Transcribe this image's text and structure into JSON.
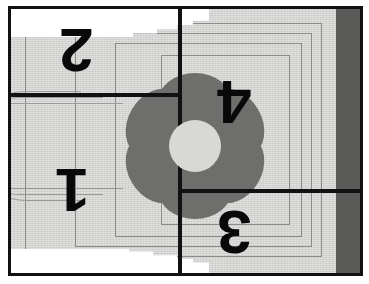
{
  "image": {
    "title": "Quilt panel photographed with four numbered quadrants",
    "width": 369,
    "height": 284
  },
  "colors": {
    "frame": "#111111",
    "cloth": "#d3d3d1",
    "petal": "#6e6e6c",
    "flower_center": "#d8d8d5",
    "shadow_band": "#5a5a58",
    "stitch_line": "#8b8b89",
    "glare": "#ffffff",
    "numeral": "#090909"
  },
  "quadrants": [
    {
      "id": "quadrant-1",
      "label": "1",
      "position": "bottom-left",
      "rotation_deg": 180
    },
    {
      "id": "quadrant-2",
      "label": "2",
      "position": "top-left",
      "rotation_deg": 180
    },
    {
      "id": "quadrant-3",
      "label": "3",
      "position": "bottom-right",
      "rotation_deg": 180
    },
    {
      "id": "quadrant-4",
      "label": "4",
      "position": "top-right",
      "rotation_deg": 180
    }
  ],
  "flower": {
    "petal_count": 6,
    "petals": [
      {
        "angle_deg": 0,
        "width": 74,
        "height": 58,
        "offset": 44
      },
      {
        "angle_deg": 60,
        "width": 74,
        "height": 58,
        "offset": 44
      },
      {
        "angle_deg": 120,
        "width": 74,
        "height": 58,
        "offset": 44
      },
      {
        "angle_deg": 180,
        "width": 74,
        "height": 58,
        "offset": 44
      },
      {
        "angle_deg": 240,
        "width": 74,
        "height": 58,
        "offset": 44
      },
      {
        "angle_deg": 300,
        "width": 74,
        "height": 58,
        "offset": 44
      }
    ]
  },
  "grid": {
    "vertical_divider_x": 167,
    "horizontal_left_y": 84,
    "horizontal_right_y": 180,
    "line_thickness": 4
  },
  "stitch_outlines": [
    {
      "id": "stitch-outline-1"
    },
    {
      "id": "stitch-outline-2"
    },
    {
      "id": "stitch-outline-3"
    },
    {
      "id": "stitch-outline-4"
    }
  ],
  "fold_curves": [
    {
      "id": "fold-curve-1"
    },
    {
      "id": "fold-curve-2"
    },
    {
      "id": "fold-curve-3"
    }
  ]
}
